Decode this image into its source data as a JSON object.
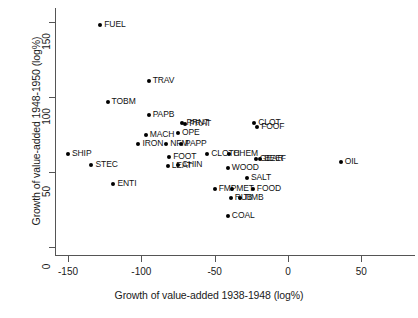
{
  "chart_data": {
    "type": "scatter",
    "title": "",
    "xlabel": "Growth of value-added 1938-1948 (log%)",
    "ylabel": "Growth of value-added 1948-1950 (log%)",
    "xlim": [
      -163,
      57
    ],
    "ylim": [
      -8,
      160
    ],
    "xticks": [
      -150,
      -100,
      -50,
      0,
      50
    ],
    "xtick_labels": [
      "-150",
      "-100",
      "-50",
      "0",
      "50"
    ],
    "yticks": [
      0,
      50,
      100,
      150
    ],
    "ytick_labels": [
      "0",
      "50",
      "100",
      "150"
    ],
    "grid": false,
    "legend": null,
    "marker": "filled-diamond",
    "marker_color": "#000000",
    "points": [
      {
        "label": "FUEL",
        "x": -128,
        "y": 148
      },
      {
        "label": "TRAV",
        "x": -95,
        "y": 111
      },
      {
        "label": "TOBM",
        "x": -123,
        "y": 97
      },
      {
        "label": "PAPB",
        "x": -95,
        "y": 88
      },
      {
        "label": "PRNT",
        "x": -72,
        "y": 83
      },
      {
        "label": "PRAT",
        "x": -70,
        "y": 82
      },
      {
        "label": "OPE",
        "x": -75,
        "y": 76
      },
      {
        "label": "MACH",
        "x": -97,
        "y": 75
      },
      {
        "label": "NFM",
        "x": -83,
        "y": 69
      },
      {
        "label": "PAPP",
        "x": -73,
        "y": 69
      },
      {
        "label": "IRON",
        "x": -102,
        "y": 69
      },
      {
        "label": "CLOT",
        "x": -23,
        "y": 83
      },
      {
        "label": "FOOF",
        "x": -21,
        "y": 80
      },
      {
        "label": "SHIP",
        "x": -150,
        "y": 62
      },
      {
        "label": "FOOT",
        "x": -81,
        "y": 60
      },
      {
        "label": "CLOTH",
        "x": -55,
        "y": 62
      },
      {
        "label": "CHEM",
        "x": -40,
        "y": 62
      },
      {
        "label": "LEAT",
        "x": -82,
        "y": 54
      },
      {
        "label": "CHIN",
        "x": -75,
        "y": 55
      },
      {
        "label": "WOOD",
        "x": -41,
        "y": 53
      },
      {
        "label": "GEAR",
        "x": -22,
        "y": 59
      },
      {
        "label": "BEEF",
        "x": -19,
        "y": 59
      },
      {
        "label": "STEC",
        "x": -134,
        "y": 55
      },
      {
        "label": "OIL",
        "x": 36,
        "y": 57
      },
      {
        "label": "SALT",
        "x": -28,
        "y": 46
      },
      {
        "label": "ENTI",
        "x": -119,
        "y": 42
      },
      {
        "label": "FMP",
        "x": -50,
        "y": 39
      },
      {
        "label": "MET",
        "x": -38,
        "y": 39
      },
      {
        "label": "FOOD",
        "x": -24,
        "y": 39
      },
      {
        "label": "RUB",
        "x": -39,
        "y": 33
      },
      {
        "label": "TIMB",
        "x": -33,
        "y": 33
      },
      {
        "label": "COAL",
        "x": -41,
        "y": 21
      }
    ]
  }
}
